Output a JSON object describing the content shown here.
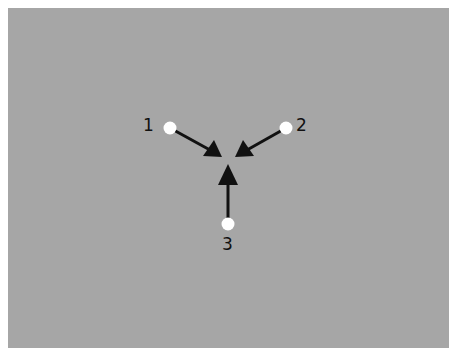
{
  "diagram": {
    "background_color": "#a6a6a6",
    "arrow_color": "#111111",
    "dot_color": "#ffffff",
    "convergence_point": [
      229,
      158
    ],
    "nodes": [
      {
        "label": "1",
        "dot": [
          170,
          128
        ],
        "label_pos": [
          142,
          118
        ],
        "arrow_tip": [
          222,
          157
        ]
      },
      {
        "label": "2",
        "dot": [
          286,
          128
        ],
        "label_pos": [
          296,
          118
        ],
        "arrow_tip": [
          235,
          157
        ]
      },
      {
        "label": "3",
        "dot": [
          228,
          224
        ],
        "label_pos": [
          221,
          237
        ],
        "arrow_tip": [
          228,
          164
        ]
      }
    ]
  }
}
